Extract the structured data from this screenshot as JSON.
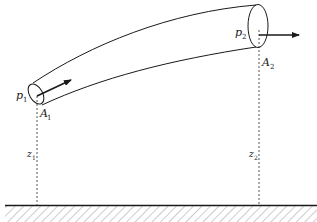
{
  "diagram": {
    "type": "bernoulli-stream-tube",
    "colors": {
      "stroke": "#1a1a1a",
      "dashed": "#555555",
      "hatch": "#9a9a9a",
      "background": "#ffffff"
    },
    "labels": {
      "p1": {
        "main": "p",
        "sub": "1"
      },
      "A1": {
        "main": "A",
        "sub": "1"
      },
      "p2": {
        "main": "p",
        "sub": "2"
      },
      "A2": {
        "main": "A",
        "sub": "2"
      },
      "z1": {
        "main": "z",
        "sub": "1"
      },
      "z2": {
        "main": "z",
        "sub": "2"
      }
    },
    "elements": [
      "stream tube (curved pipe segment)",
      "inlet cross-section ellipse",
      "outlet cross-section ellipse",
      "inlet velocity arrow",
      "outlet velocity arrow",
      "dashed height line z1",
      "dashed height line z2",
      "ground reference line with hatching"
    ]
  }
}
